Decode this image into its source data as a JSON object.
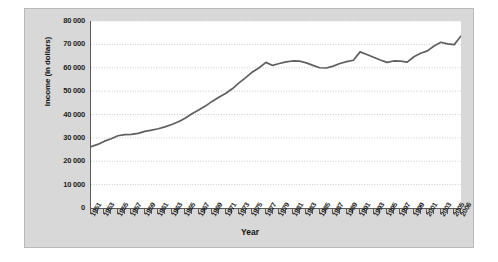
{
  "chart_data": {
    "type": "line",
    "title": "",
    "xlabel": "Year",
    "ylabel": "Income (in dollars)",
    "xlim": [
      1951,
      2006
    ],
    "ylim": [
      0,
      80000
    ],
    "grid": true,
    "legend": "none",
    "line_color": "#5f5f5f",
    "plot_background": "#ffffff",
    "figure_background": "#d8d8d8",
    "ytick_labels": [
      "80 000",
      "70 000",
      "60 000",
      "50 000",
      "40 000",
      "30 000",
      "20 000",
      "10 000",
      "0"
    ],
    "ytick_values": [
      80000,
      70000,
      60000,
      50000,
      40000,
      30000,
      20000,
      10000,
      0
    ],
    "xtick_labels": [
      "1951",
      "1953",
      "1955",
      "1957",
      "1959",
      "1961",
      "1963",
      "1965",
      "1967",
      "1969",
      "1971",
      "1973",
      "1975",
      "1977",
      "1979",
      "1981",
      "1983",
      "1985",
      "1987",
      "1989",
      "1991",
      "1993",
      "1995",
      "1997",
      "1999",
      "2001",
      "2003",
      "2005",
      "2006"
    ],
    "x": [
      1951,
      1952,
      1953,
      1954,
      1955,
      1956,
      1957,
      1958,
      1959,
      1960,
      1961,
      1962,
      1963,
      1964,
      1965,
      1966,
      1967,
      1968,
      1969,
      1970,
      1971,
      1972,
      1973,
      1974,
      1975,
      1976,
      1977,
      1978,
      1979,
      1980,
      1981,
      1982,
      1983,
      1984,
      1985,
      1986,
      1987,
      1988,
      1989,
      1990,
      1991,
      1992,
      1993,
      1994,
      1995,
      1996,
      1997,
      1998,
      1999,
      2000,
      2001,
      2002,
      2003,
      2004,
      2005,
      2006
    ],
    "values": [
      26200,
      27200,
      28600,
      29600,
      30900,
      31400,
      31500,
      31900,
      32800,
      33300,
      33900,
      34700,
      35700,
      36900,
      38400,
      40300,
      41900,
      43600,
      45600,
      47400,
      49000,
      51000,
      53500,
      55800,
      58200,
      60000,
      62300,
      61000,
      61800,
      62500,
      62900,
      62800,
      62100,
      61000,
      60000,
      59900,
      60700,
      61800,
      62600,
      63200,
      66800,
      65700,
      64500,
      63300,
      62300,
      62900,
      62800,
      62400,
      64700,
      66200,
      67200,
      69300,
      70900,
      70200,
      69900,
      73600
    ]
  }
}
